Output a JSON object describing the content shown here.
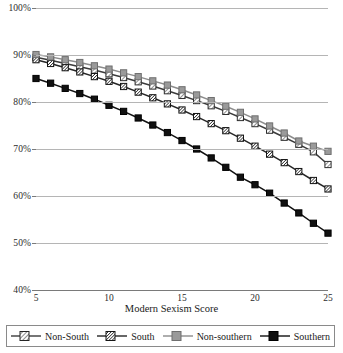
{
  "chart_data": {
    "type": "line",
    "title": "",
    "subtitle": "",
    "xlabel": "Modern Sexism Score",
    "ylabel": "",
    "xlim": [
      5,
      25
    ],
    "ylim": [
      40,
      100
    ],
    "grid": true,
    "legend_position": "bottom",
    "x": [
      5,
      6,
      7,
      8,
      9,
      10,
      11,
      12,
      13,
      14,
      15,
      16,
      17,
      18,
      19,
      20,
      21,
      22,
      23,
      24,
      25
    ],
    "x_ticks": [
      "5",
      "10",
      "15",
      "20",
      "25"
    ],
    "x_tick_values": [
      5,
      10,
      15,
      20,
      25
    ],
    "y_ticks": [
      "40%",
      "50%",
      "60%",
      "70%",
      "80%",
      "90%",
      "100%"
    ],
    "y_tick_values": [
      40,
      50,
      60,
      70,
      80,
      90,
      100
    ],
    "series": [
      {
        "name": "Non-South",
        "marker": "square-hatch-light",
        "fill": "#ffffff",
        "stroke": "#3b3b3b",
        "values": [
          89.5,
          88.9,
          88.2,
          87.5,
          86.8,
          86.0,
          85.2,
          84.3,
          83.4,
          82.4,
          81.4,
          80.3,
          79.2,
          78.0,
          76.7,
          75.4,
          74.0,
          72.5,
          71.0,
          69.4,
          66.7
        ]
      },
      {
        "name": "South",
        "marker": "square-hatch-heavy",
        "fill": "#ffffff",
        "stroke": "#262626",
        "values": [
          89.0,
          88.2,
          87.3,
          86.4,
          85.4,
          84.4,
          83.3,
          82.1,
          80.9,
          79.6,
          78.3,
          76.9,
          75.4,
          73.9,
          72.3,
          70.6,
          68.9,
          67.1,
          65.2,
          63.3,
          61.5
        ]
      },
      {
        "name": "Non-southern",
        "marker": "square-solid",
        "fill": "#9a9a9a",
        "stroke": "#8c8c8c",
        "values": [
          90.1,
          89.6,
          89.0,
          88.4,
          87.7,
          87.0,
          86.2,
          85.4,
          84.5,
          83.6,
          82.6,
          81.5,
          80.3,
          79.1,
          77.8,
          76.4,
          74.9,
          73.4,
          71.7,
          70.6,
          69.5
        ]
      },
      {
        "name": "Southern",
        "marker": "square-solid",
        "fill": "#111111",
        "stroke": "#111111",
        "values": [
          85.0,
          84.0,
          82.9,
          81.8,
          80.6,
          79.3,
          78.0,
          76.6,
          75.1,
          73.5,
          71.8,
          70.0,
          68.1,
          66.1,
          64.0,
          62.4,
          60.6,
          58.5,
          56.4,
          54.2,
          52.1
        ]
      }
    ]
  },
  "legend": {
    "items": [
      {
        "label": "Non-South",
        "swatch": "square-hatch-light"
      },
      {
        "label": "South",
        "swatch": "square-hatch-heavy"
      },
      {
        "label": "Non-southern",
        "swatch": "square-solid-gray"
      },
      {
        "label": "Southern",
        "swatch": "square-solid-black"
      }
    ]
  },
  "colors": {
    "gray_series": "#9a9a9a",
    "black_series": "#111111",
    "grid": "#b5b5b5",
    "axis": "#7a7a7a",
    "text": "#1a1a1a"
  }
}
